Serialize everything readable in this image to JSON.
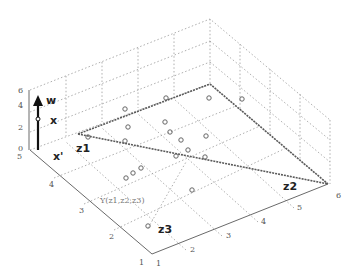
{
  "figure": {
    "type": "3d-subspace-diagram",
    "labels": {
      "w": "w",
      "x": "x",
      "x_prime": "x'",
      "z1": "z1",
      "z2": "z2",
      "z3": "z3",
      "span": "Y(z1,z2,z3)"
    },
    "z_axis_ticks": [
      "6",
      "4",
      "2",
      "0"
    ],
    "left_floor_ticks": [
      "5",
      "4",
      "3",
      "2",
      "1"
    ],
    "right_floor_ticks": [
      "1",
      "2",
      "3",
      "4",
      "5",
      "6"
    ],
    "colors": {
      "grid": "#9a9a9a",
      "axis": "#6a6a6a",
      "plane_edge": "#5a5a5a",
      "vector": "#111111",
      "points": "#666666"
    },
    "point_count": 24
  }
}
